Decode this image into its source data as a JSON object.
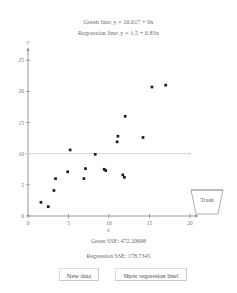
{
  "header": {
    "green_line_equation": "Green line: y = 10.017 + 0x",
    "regression_line_equation": "Regression line: y = 1.5 + 0.83x"
  },
  "footer": {
    "green_sse": "Green SSE: 472.20698",
    "regression_sse": "Regression SSE: 178.7345"
  },
  "buttons": {
    "new_data": "New data",
    "show_regression_line": "Show regression line!"
  },
  "trash": {
    "label": "Trash",
    "icon": "trash-can-icon"
  },
  "colors": {
    "green_line": "#d9dcd9",
    "axis": "#8d8d8d",
    "point": "#1b1b1b",
    "text": "#6b6b6b",
    "background": "#ffffff"
  },
  "chart_data": {
    "type": "scatter",
    "title": "",
    "xlabel": "x",
    "ylabel": "y",
    "xlim": [
      0,
      20
    ],
    "ylim": [
      0,
      26
    ],
    "xticks": [
      0,
      5,
      10,
      15,
      20
    ],
    "yticks": [
      0,
      5,
      10,
      15,
      20,
      25
    ],
    "grid": false,
    "legend": null,
    "points": [
      {
        "x": 1.6,
        "y": 2.2
      },
      {
        "x": 2.5,
        "y": 1.5
      },
      {
        "x": 3.2,
        "y": 4.1
      },
      {
        "x": 3.4,
        "y": 6.0
      },
      {
        "x": 4.9,
        "y": 7.1
      },
      {
        "x": 5.2,
        "y": 10.6
      },
      {
        "x": 6.9,
        "y": 6.0
      },
      {
        "x": 7.1,
        "y": 7.6
      },
      {
        "x": 8.3,
        "y": 9.9
      },
      {
        "x": 9.4,
        "y": 7.5
      },
      {
        "x": 9.6,
        "y": 7.3
      },
      {
        "x": 11.0,
        "y": 11.9
      },
      {
        "x": 11.1,
        "y": 12.8
      },
      {
        "x": 11.7,
        "y": 6.6
      },
      {
        "x": 11.9,
        "y": 6.2
      },
      {
        "x": 12.0,
        "y": 16.0
      },
      {
        "x": 14.2,
        "y": 12.6
      },
      {
        "x": 15.3,
        "y": 20.7
      },
      {
        "x": 17.0,
        "y": 21.0
      }
    ],
    "lines": [
      {
        "name": "green-line",
        "type": "horizontal",
        "intercept": 10.017,
        "slope": 0,
        "color": "#d9dcd9",
        "visible": true
      },
      {
        "name": "regression-line",
        "intercept": 1.5,
        "slope": 0.83,
        "visible": false
      }
    ]
  }
}
